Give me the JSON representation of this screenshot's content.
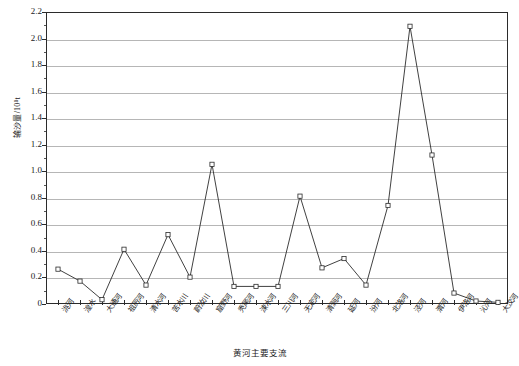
{
  "chart_data": {
    "type": "line",
    "title": "",
    "xlabel": "黄河主要支流",
    "ylabel": "输沙量/10⁸t",
    "ylim": [
      0,
      2.2
    ],
    "ytick_step": 0.2,
    "grid": "horizontal",
    "legend": "none",
    "marker": "open-square",
    "line_color": "#2b2b2b",
    "grid_color": "#b6b6b6",
    "axis_color": "#2b2b2b",
    "categories": [
      "洮河",
      "湟水",
      "大通河",
      "祖厉河",
      "清水河",
      "苦水川",
      "蔚汝川",
      "窟野河",
      "秃尾河",
      "涑水河",
      "三川河",
      "无定河",
      "清涧河",
      "延河",
      "汾河",
      "北洛河",
      "泾河",
      "渭河",
      "伊洛河",
      "沁河",
      "大汶河"
    ],
    "values": [
      0.27,
      0.18,
      0.04,
      0.42,
      0.15,
      0.53,
      0.21,
      1.06,
      0.14,
      0.14,
      0.14,
      0.82,
      0.28,
      0.35,
      0.15,
      0.75,
      2.1,
      1.13,
      0.09,
      0.03,
      0.02
    ],
    "ytick_labels": [
      "0",
      "0.2",
      "0.4",
      "0.6",
      "0.8",
      "1.0",
      "1.2",
      "1.4",
      "1.6",
      "1.8",
      "2.0",
      "2.2"
    ]
  }
}
